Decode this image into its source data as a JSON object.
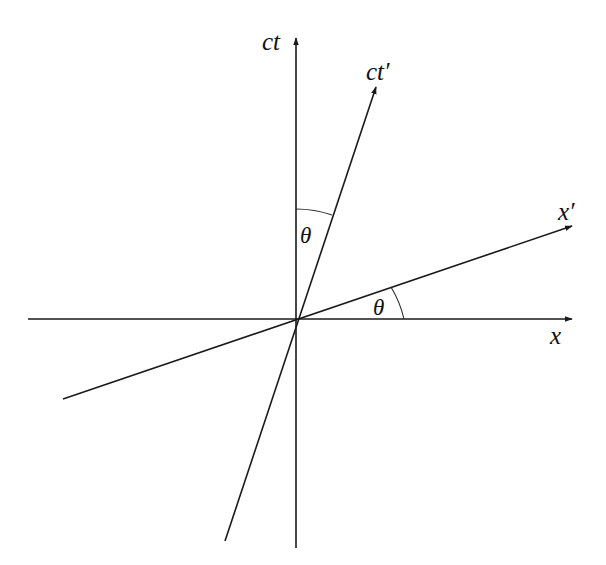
{
  "diagram": {
    "origin": {
      "x": 296,
      "y": 319
    },
    "colors": {
      "line": "#1a1a1a",
      "text": "#111111",
      "background": "#ffffff"
    },
    "axes": [
      {
        "id": "x",
        "label": "x",
        "from": [
          28,
          319
        ],
        "to": [
          572,
          319
        ],
        "label_pos": [
          550,
          344
        ]
      },
      {
        "id": "ct",
        "label": "ct",
        "from": [
          296,
          548
        ],
        "to": [
          296,
          38
        ],
        "label_pos": [
          262,
          50
        ]
      },
      {
        "id": "x_prime",
        "label": "x′",
        "from": [
          63,
          399
        ],
        "to": [
          572,
          226
        ],
        "label_pos": [
          558,
          220
        ]
      },
      {
        "id": "ct_prime",
        "label": "ct′",
        "from": [
          225,
          541
        ],
        "to": [
          376,
          87
        ],
        "label_pos": [
          366,
          80
        ]
      }
    ],
    "angles": [
      {
        "id": "theta-between-ct-and-ct-prime",
        "label": "θ",
        "arc": "M 296 209 A 110 110 0 0 1 332 215",
        "label_pos": [
          309,
          242
        ]
      },
      {
        "id": "theta-between-x-and-x-prime",
        "label": "θ",
        "arc": "M 391 287 A 108 108 0 0 1 404 319",
        "label_pos": [
          382,
          314
        ]
      }
    ]
  }
}
